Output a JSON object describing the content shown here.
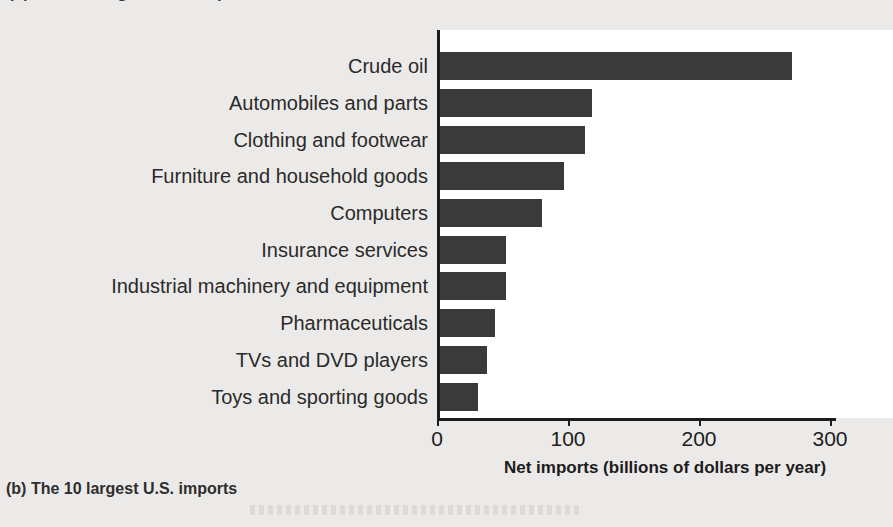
{
  "page": {
    "clipped_top_text": "(a) The 10 largest U.S. exports",
    "caption": "(b) The 10 largest U.S. imports",
    "background_color": "#eceae8",
    "bar_color": "#3a3a3a",
    "text_color": "#1c1c1c"
  },
  "chart_data": {
    "type": "bar",
    "orientation": "horizontal",
    "title": "",
    "xlabel": "Net imports (billions of dollars per year)",
    "ylabel": "",
    "xlim": [
      0,
      340
    ],
    "xticks": [
      0,
      100,
      200,
      300
    ],
    "xticklabels": [
      "0",
      "100",
      "200",
      "300"
    ],
    "grid": false,
    "legend": false,
    "categories": [
      "Crude oil",
      "Automobiles and parts",
      "Clothing and footwear",
      "Furniture and household goods",
      "Computers",
      "Insurance services",
      "Industrial machinery and equipment",
      "Pharmaceuticals",
      "TVs and DVD players",
      "Toys and sporting goods"
    ],
    "values": [
      269,
      116,
      111,
      95,
      78,
      50,
      50,
      42,
      36,
      29
    ],
    "units": "billions of dollars per year"
  }
}
